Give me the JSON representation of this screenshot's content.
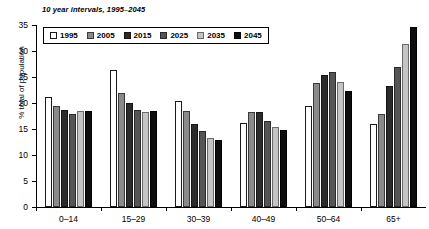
{
  "chart_data": {
    "type": "bar",
    "title": "10 year intervals, 1995–2045",
    "xlabel": "",
    "ylabel": "% total of population",
    "ylim": [
      0,
      35
    ],
    "yticks": [
      0,
      5,
      10,
      15,
      20,
      25,
      30,
      35
    ],
    "grid": false,
    "legend_position": "top-left",
    "categories": [
      "0–14",
      "15–29",
      "30–39",
      "40–49",
      "50–64",
      "65+"
    ],
    "series": [
      {
        "name": "1995",
        "color": "#ffffff",
        "values": [
          21.1,
          26.3,
          20.4,
          16.2,
          19.4,
          15.9
        ]
      },
      {
        "name": "2005",
        "color": "#8a8a8a",
        "values": [
          19.5,
          22.0,
          18.5,
          18.2,
          23.8,
          17.9
        ]
      },
      {
        "name": "2015",
        "color": "#2b2b2b",
        "values": [
          18.6,
          20.0,
          16.0,
          18.2,
          25.3,
          23.3
        ]
      },
      {
        "name": "2025",
        "color": "#555555",
        "values": [
          17.8,
          18.6,
          14.7,
          16.6,
          26.0,
          26.9
        ]
      },
      {
        "name": "2035",
        "color": "#c4c4c4",
        "values": [
          18.5,
          18.3,
          13.2,
          15.3,
          24.0,
          31.4
        ]
      },
      {
        "name": "2045",
        "color": "#0d0d0d",
        "values": [
          18.5,
          18.4,
          12.8,
          14.9,
          22.4,
          34.6
        ]
      }
    ]
  }
}
